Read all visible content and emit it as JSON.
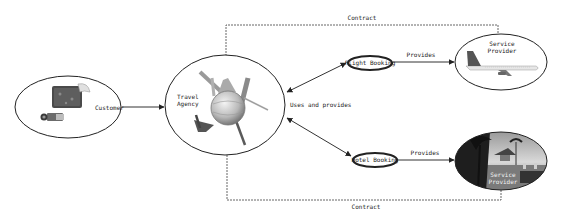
{
  "diagram": {
    "type": "travel-agency-flow",
    "nodes": {
      "customer": {
        "label": "Customer",
        "image": "suitcase-and-camera"
      },
      "travel_agency": {
        "label_line1": "Travel",
        "label_line2": "Agency",
        "image": "globe-with-landmarks"
      },
      "flight_booking": {
        "label": "Flight Booking"
      },
      "hotel_booking": {
        "label": "Hotel Booking"
      },
      "service_provider_flight": {
        "label_line1": "Service",
        "label_line2": "Provider",
        "image": "airplane"
      },
      "service_provider_hotel": {
        "label_line1": "Service",
        "label_line2": "Provider",
        "image": "tropical-resort"
      }
    },
    "edges": {
      "customer_to_agency": "",
      "agency_bookings": "Uses and provides",
      "flight_provides": "Provides",
      "hotel_provides": "Provides",
      "contract_top": "Contract",
      "contract_bottom": "Contract"
    },
    "colors": {
      "stroke": "#222222",
      "background": "#ffffff",
      "hotel_photo_dark": "#2a2a2a"
    }
  }
}
